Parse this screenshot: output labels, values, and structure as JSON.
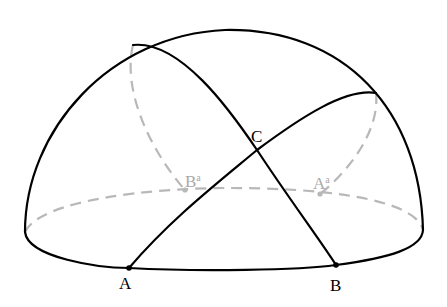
{
  "diagram": {
    "type": "hemisphere with great-circle arcs",
    "colors": {
      "visible_line": "#000000",
      "hidden_line": "#b8b8b8",
      "hidden_label": "#a9a9a9"
    },
    "points": {
      "A": {
        "label": "A",
        "x": 129,
        "y": 268
      },
      "B": {
        "label": "B",
        "x": 336,
        "y": 265
      },
      "C": {
        "label": "C",
        "x": 257,
        "y": 150
      },
      "A_prime": {
        "label": "A",
        "superscript": "a",
        "x": 320,
        "y": 194
      },
      "B_prime": {
        "label": "B",
        "superscript": "a",
        "x": 185,
        "y": 190
      }
    },
    "labels": {
      "A": "A",
      "B": "B",
      "C": "C",
      "A_prime_base": "A",
      "A_prime_sup": "a",
      "B_prime_base": "B",
      "B_prime_sup": "a"
    }
  }
}
